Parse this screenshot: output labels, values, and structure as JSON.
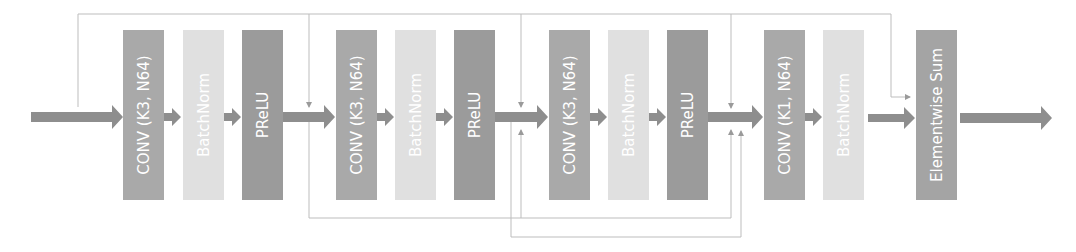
{
  "diagram": {
    "blocks": [
      {
        "label": "CONV (K3, N64)",
        "type": "conv",
        "x": 123,
        "color": "#a9a9a9"
      },
      {
        "label": "BatchNorm",
        "type": "batchnorm",
        "x": 183,
        "color": "#e0e0e0"
      },
      {
        "label": "PReLU",
        "type": "prelu",
        "x": 242,
        "color": "#9b9b9b"
      },
      {
        "label": "CONV (K3, N64)",
        "type": "conv",
        "x": 336,
        "color": "#a9a9a9"
      },
      {
        "label": "BatchNorm",
        "type": "batchnorm",
        "x": 395,
        "color": "#e0e0e0"
      },
      {
        "label": "PReLU",
        "type": "prelu",
        "x": 454,
        "color": "#9b9b9b"
      },
      {
        "label": "CONV (K3, N64)",
        "type": "conv",
        "x": 549,
        "color": "#a9a9a9"
      },
      {
        "label": "BatchNorm",
        "type": "batchnorm",
        "x": 608,
        "color": "#e0e0e0"
      },
      {
        "label": "PReLU",
        "type": "prelu",
        "x": 667,
        "color": "#9b9b9b"
      },
      {
        "label": "CONV (K1, N64)",
        "type": "conv",
        "x": 764,
        "color": "#a9a9a9"
      },
      {
        "label": "BatchNorm",
        "type": "batchnorm",
        "x": 823,
        "color": "#e0e0e0"
      },
      {
        "label": "Elementwise Sum",
        "type": "sum",
        "x": 916,
        "color": "#a4a4a4"
      }
    ],
    "colors": {
      "arrow": "#8e8e8e",
      "skip_line": "#bdbdbd",
      "label_text": "#ffffff",
      "background": "#ffffff"
    }
  }
}
